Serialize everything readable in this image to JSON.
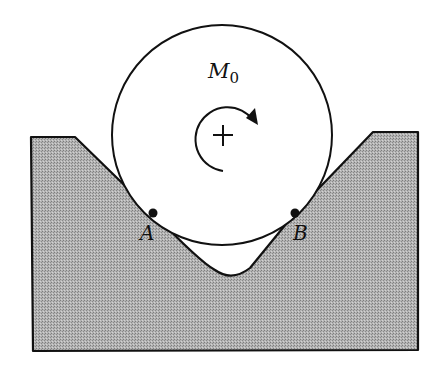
{
  "diagram": {
    "moment_label": "M",
    "moment_subscript": "0",
    "contact_point_a": "A",
    "contact_point_b": "B",
    "colors": {
      "ground_fill": "#a9a9a9",
      "stroke": "#111111",
      "background": "#ffffff"
    },
    "circle": {
      "cx": 222,
      "cy": 135,
      "r": 110
    },
    "contacts": {
      "A": [
        153,
        213
      ],
      "B": [
        295,
        213
      ]
    }
  }
}
